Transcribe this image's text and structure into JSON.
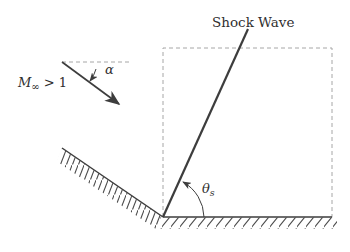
{
  "figure": {
    "title_label": "Shock Wave",
    "freestream": {
      "symbol": "M",
      "subscript": "∞",
      "condition": " > 1"
    },
    "angles": {
      "incidence": "α",
      "shock_symbol": "θ",
      "shock_subscript": "s"
    },
    "colors": {
      "line": "#3d3d3d",
      "dashed": "#a6a6a6",
      "text": "#2f2f2f"
    }
  }
}
